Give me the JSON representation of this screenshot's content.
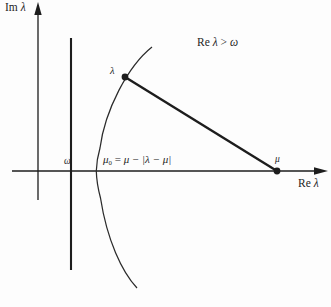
{
  "figure": {
    "title_alt": "Complex plane diagram for Re lambda greater than omega",
    "background_color": "#fdfdfd",
    "ink_color": "#1d1d1d"
  },
  "axes": {
    "imaginary": {
      "label_prefix": "Im ",
      "label_symbol": "λ",
      "label_full": "Im λ",
      "orientation": "vertical",
      "arrow": "up"
    },
    "real": {
      "label_prefix": "Re ",
      "label_symbol": "λ",
      "label_full": "Re λ",
      "orientation": "horizontal",
      "arrow": "right"
    }
  },
  "annotations": {
    "region_condition": {
      "prefix": "Re ",
      "symbol": "λ",
      "relation": " > ",
      "bound": "ω",
      "full": "Re λ > ω"
    },
    "formula": {
      "lhs_symbol": "μ",
      "lhs_subscript": "0",
      "equals": " = ",
      "rhs": "μ − |λ − μ|",
      "full": "μ₀ = μ − |λ − μ|"
    }
  },
  "points": [
    {
      "name": "lambda",
      "label": "λ",
      "x": 125,
      "y": 77,
      "on": "parabola"
    },
    {
      "name": "mu",
      "label": "μ",
      "x": 277,
      "y": 171,
      "on": "real-axis"
    }
  ],
  "markers": {
    "omega_line_label": "ω"
  },
  "colors": {
    "stroke": "#1d1d1d",
    "thin_stroke": "#2b2b2b",
    "background": "#fdfdfd"
  }
}
